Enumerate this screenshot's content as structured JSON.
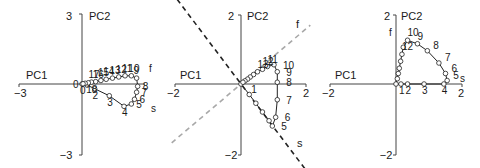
{
  "chart_data": [
    {
      "type": "line",
      "panel": 1,
      "xlabel": "PC1",
      "ylabel": "PC2",
      "xlim": [
        -3,
        3
      ],
      "ylim": [
        -3,
        3
      ],
      "tick_labels": {
        "xmin": "−3",
        "ymax": "3",
        "ymin": "−3",
        "origin": "0"
      },
      "grid": false,
      "axis_annotations": [
        {
          "label": "f",
          "x": 2.85,
          "y": 0.55
        },
        {
          "label": "s",
          "x": 2.6,
          "y": -1.55
        }
      ],
      "series": [
        {
          "name": "trajectory",
          "marker": "open-circle",
          "points": [
            {
              "label": "0",
              "x": 0.0,
              "y": 0.0
            },
            {
              "label": "1",
              "x": 0.25,
              "y": -0.05
            },
            {
              "label": "2",
              "x": 0.6,
              "y": -0.2
            },
            {
              "label": "3",
              "x": 1.3,
              "y": -0.5
            },
            {
              "label": "4",
              "x": 2.0,
              "y": -0.95
            },
            {
              "label": "5",
              "x": 2.35,
              "y": -0.85
            },
            {
              "label": "6",
              "x": 2.5,
              "y": -0.65
            },
            {
              "label": "7",
              "x": 2.6,
              "y": -0.35
            },
            {
              "label": "8",
              "x": 2.65,
              "y": -0.1
            },
            {
              "label": "9",
              "x": 2.6,
              "y": 0.25
            },
            {
              "label": "10",
              "x": 2.35,
              "y": 0.35
            },
            {
              "label": "11",
              "x": 2.05,
              "y": 0.35
            },
            {
              "label": "12",
              "x": 1.75,
              "y": 0.3
            },
            {
              "label": "13",
              "x": 1.45,
              "y": 0.25
            },
            {
              "label": "14",
              "x": 1.15,
              "y": 0.2
            },
            {
              "label": "15",
              "x": 0.9,
              "y": 0.15
            },
            {
              "label": "16",
              "x": 0.65,
              "y": 0.1
            },
            {
              "label": "17",
              "x": 0.45,
              "y": 0.08
            },
            {
              "label": "18",
              "x": 0.3,
              "y": 0.05
            },
            {
              "label": "19",
              "x": 0.15,
              "y": 0.03
            },
            {
              "label": "20",
              "x": 0.05,
              "y": 0.01
            }
          ]
        }
      ],
      "point_labels_visible": [
        "0",
        "2",
        "3",
        "4",
        "5",
        "6",
        "7",
        "8",
        "9",
        "10",
        "11",
        "12",
        "13",
        "14",
        "15",
        "16",
        "17",
        "18"
      ]
    },
    {
      "type": "line",
      "panel": 2,
      "xlabel": "PC1",
      "ylabel": "PC2",
      "xlim": [
        -2,
        2
      ],
      "ylim": [
        -2,
        2
      ],
      "tick_labels": {
        "xmin": "−2",
        "xmax": "2",
        "ymax": "2",
        "ymin": "−2"
      },
      "grid": false,
      "reference_lines": [
        {
          "label": "f",
          "style": "dashed",
          "color": "#a8a8a8",
          "slope": 0.8
        },
        {
          "label": "s",
          "style": "dashed",
          "color": "#222222",
          "slope": -1.25
        }
      ],
      "series": [
        {
          "name": "trajectory",
          "marker": "open-circle",
          "points": [
            {
              "label": "0",
              "x": 0.0,
              "y": 0.0
            },
            {
              "label": "1",
              "x": 0.25,
              "y": -0.3
            },
            {
              "label": "2",
              "x": 0.45,
              "y": -0.55
            },
            {
              "label": "3",
              "x": 0.65,
              "y": -0.8
            },
            {
              "label": "4",
              "x": 0.85,
              "y": -1.05
            },
            {
              "label": "5",
              "x": 0.95,
              "y": -1.2
            },
            {
              "label": "6",
              "x": 1.05,
              "y": -0.95
            },
            {
              "label": "7",
              "x": 1.1,
              "y": -0.45
            },
            {
              "label": "8",
              "x": 1.1,
              "y": 0.05
            },
            {
              "label": "9",
              "x": 1.1,
              "y": 0.35
            },
            {
              "label": "10",
              "x": 1.0,
              "y": 0.55
            },
            {
              "label": "11",
              "x": 0.8,
              "y": 0.5
            },
            {
              "label": "12",
              "x": 0.65,
              "y": 0.42
            },
            {
              "label": "13",
              "x": 0.5,
              "y": 0.35
            },
            {
              "label": "14",
              "x": 0.38,
              "y": 0.27
            },
            {
              "label": "15",
              "x": 0.28,
              "y": 0.2
            },
            {
              "label": "16",
              "x": 0.2,
              "y": 0.14
            },
            {
              "label": "17",
              "x": 0.12,
              "y": 0.09
            },
            {
              "label": "18",
              "x": 0.06,
              "y": 0.05
            }
          ]
        }
      ],
      "point_labels_visible": [
        "1",
        "5",
        "6",
        "7",
        "8",
        "9",
        "10",
        "11",
        "12",
        "13"
      ]
    },
    {
      "type": "line",
      "panel": 3,
      "xlabel": "PC1",
      "ylabel": "PC2",
      "xlim": [
        -2,
        2
      ],
      "ylim": [
        -2,
        2
      ],
      "tick_labels": {
        "xmin": "−2",
        "xmax": "2",
        "ymax": "2",
        "ymin": "−2"
      },
      "grid": false,
      "axis_annotations": [
        {
          "label": "f",
          "x": -0.55,
          "y": 1.4
        },
        {
          "label": "s",
          "x": 1.85,
          "y": 0.25
        }
      ],
      "series": [
        {
          "name": "trajectory",
          "marker": "open-circle",
          "points": [
            {
              "label": "0",
              "x": 0.0,
              "y": 0.0
            },
            {
              "label": "1",
              "x": 0.15,
              "y": 0.0
            },
            {
              "label": "2",
              "x": 0.35,
              "y": 0.0
            },
            {
              "label": "3",
              "x": 0.85,
              "y": 0.0
            },
            {
              "label": "4",
              "x": 1.45,
              "y": 0.0
            },
            {
              "label": "5",
              "x": 1.55,
              "y": 0.1
            },
            {
              "label": "6",
              "x": 1.5,
              "y": 0.3
            },
            {
              "label": "7",
              "x": 1.3,
              "y": 0.6
            },
            {
              "label": "8",
              "x": 0.95,
              "y": 0.95
            },
            {
              "label": "9",
              "x": 0.65,
              "y": 1.15
            },
            {
              "label": "10",
              "x": 0.35,
              "y": 1.25
            },
            {
              "label": "11",
              "x": 0.22,
              "y": 1.05
            },
            {
              "label": "12",
              "x": 0.18,
              "y": 0.85
            },
            {
              "label": "13",
              "x": 0.14,
              "y": 0.65
            },
            {
              "label": "14",
              "x": 0.1,
              "y": 0.45
            },
            {
              "label": "15",
              "x": 0.07,
              "y": 0.3
            },
            {
              "label": "16",
              "x": 0.04,
              "y": 0.15
            }
          ]
        }
      ],
      "point_labels_visible": [
        "1",
        "2",
        "3",
        "4",
        "5",
        "6",
        "7",
        "8",
        "9",
        "10",
        "12"
      ]
    }
  ],
  "panels": [
    {
      "xlabel": "PC1",
      "ylabel": "PC2",
      "xmin_label": "−3",
      "ymax_label": "3",
      "ymin_label": "−3",
      "origin_label": "0",
      "f_label": "f",
      "s_label": "s"
    },
    {
      "xlabel": "PC1",
      "ylabel": "PC2",
      "xmin_label": "−2",
      "xmax_label": "2",
      "ymax_label": "2",
      "ymin_label": "−2",
      "f_label": "f",
      "s_label": "s"
    },
    {
      "xlabel": "PC1",
      "ylabel": "PC2",
      "xmin_label": "−2",
      "xmax_label": "2",
      "ymax_label": "2",
      "ymin_label": "−2",
      "f_label": "f",
      "s_label": "s"
    }
  ],
  "colors": {
    "axis": "#444444",
    "line": "#222222",
    "marker_fill": "#ffffff",
    "f_line": "#a8a8a8",
    "s_line": "#222222"
  }
}
